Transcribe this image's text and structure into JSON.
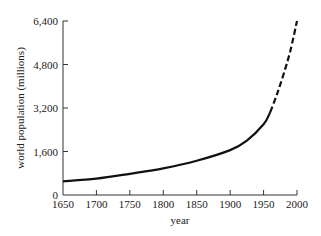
{
  "chart_data": {
    "type": "line",
    "title": "",
    "xlabel": "year",
    "ylabel": "world population (millions)",
    "xlim": [
      1650,
      2000
    ],
    "ylim": [
      0,
      6400
    ],
    "grid": false,
    "legend": null,
    "x_ticks": [
      1650,
      1700,
      1750,
      1800,
      1850,
      1900,
      1950,
      2000
    ],
    "x_tick_labels": [
      "1650",
      "1700",
      "1750",
      "1800",
      "1850",
      "1900",
      "1950",
      "2000"
    ],
    "y_ticks": [
      0,
      1600,
      3200,
      4800,
      6400
    ],
    "y_tick_labels": [
      "0",
      "1,600",
      "3,200",
      "4,800",
      "6,400"
    ],
    "series": [
      {
        "name": "observed",
        "style": "solid",
        "x": [
          1650,
          1700,
          1750,
          1800,
          1850,
          1900,
          1925,
          1950,
          1960
        ],
        "values": [
          500,
          600,
          780,
          980,
          1260,
          1650,
          2000,
          2600,
          3050
        ]
      },
      {
        "name": "projected",
        "style": "dashed",
        "x": [
          1960,
          1970,
          1980,
          1990,
          2000
        ],
        "values": [
          3050,
          3700,
          4450,
          5300,
          6400
        ]
      }
    ],
    "color": "#111111"
  }
}
